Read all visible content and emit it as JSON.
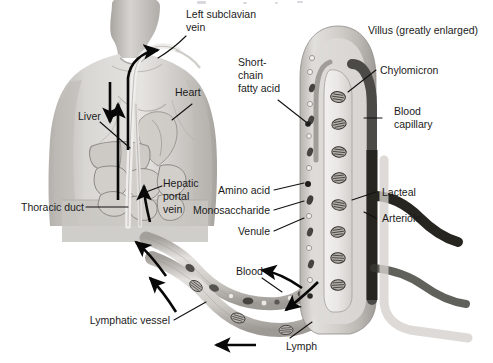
{
  "figure": {
    "title": "Villus (greatly enlarged)",
    "background_color": "#ffffff",
    "text_color": "#1b1b1b",
    "width": 493,
    "height": 363
  },
  "labels": {
    "left_subclavian_vein_line1": "Left subclavian",
    "left_subclavian_vein_line2": "vein",
    "heart": "Heart",
    "liver": "Liver",
    "thoracic_duct": "Thoracic duct",
    "hepatic_portal_vein_line1": "Hepatic",
    "hepatic_portal_vein_line2": "portal",
    "hepatic_portal_vein_line3": "vein",
    "lymphatic_vessel": "Lymphatic vessel",
    "short_chain_fatty_acid_line1": "Short-",
    "short_chain_fatty_acid_line2": "chain",
    "short_chain_fatty_acid_line3": "fatty acid",
    "amino_acid": "Amino acid",
    "monosaccharide": "Monosaccharide",
    "venule": "Venule",
    "blood": "Blood",
    "lymph": "Lymph",
    "villus_title": "Villus (greatly enlarged)",
    "chylomicron": "Chylomicron",
    "blood_capillary_line1": "Blood",
    "blood_capillary_line2": "capillary",
    "lacteal": "Lacteal",
    "arteriole": "Arteriole"
  },
  "colors": {
    "skin_light": "#e3e1de",
    "skin_mid": "#c9c6c2",
    "skin_dark": "#a9a5a1",
    "organ_outline": "#8e8b88",
    "vessel_pale": "#dcdad6",
    "vessel_mid": "#b5b2ad",
    "capillary_dark": "#55534f",
    "arteriole_dark": "#2a2927",
    "particle_dark": "#3c3a37",
    "leader_black": "#111111"
  },
  "structures": [
    {
      "name": "torso",
      "description": "grayscale male torso, head and shoulders, upper body"
    },
    {
      "name": "villus",
      "description": "enlarged intestinal villus finger with lacteal core and capillary loop"
    },
    {
      "name": "lymphatic-vessel-tube",
      "description": "pale S-curved lymph vessel carrying chylomicrons"
    },
    {
      "name": "blood-vessel-tube",
      "description": "S-curved blood vessel carrying nutrient particles"
    },
    {
      "name": "arteriole-vessel",
      "description": "dark vertical arteriole branching to the right"
    }
  ],
  "flow_arrows": [
    {
      "name": "subclavian-entry-arrow",
      "direction": "up-right into left subclavian vein"
    },
    {
      "name": "thoracic-duct-up-arrow",
      "direction": "up along thoracic duct"
    },
    {
      "name": "hepatic-portal-down-arrow",
      "direction": "down toward liver"
    },
    {
      "name": "hepatic-portal-up-arrow",
      "direction": "up from intestine to liver"
    },
    {
      "name": "lymph-upflow-arrow",
      "direction": "up-left along lymphatic vessel"
    },
    {
      "name": "blood-upflow-arrow",
      "direction": "up-left along blood vessel"
    },
    {
      "name": "blood-inflow-arrow",
      "direction": "down-left from villus into blood vessel"
    },
    {
      "name": "lymph-inflow-arrow",
      "direction": "down-left from villus into lymphatic vessel"
    },
    {
      "name": "lymph-bottom-arrow",
      "direction": "left along lower lymphatic vessel"
    }
  ]
}
